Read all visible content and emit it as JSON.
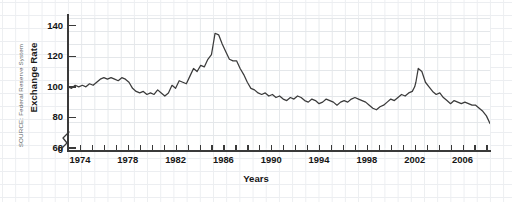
{
  "source_note": "SOURCE: Federal Reserve System",
  "chart_data": {
    "type": "line",
    "title": "",
    "subtitle": "",
    "xlabel": "Years",
    "ylabel": "Exchange Rate",
    "xlim": [
      1973.0,
      2008.3
    ],
    "ylim": [
      60,
      145
    ],
    "y_axis_break": true,
    "y_break_labels": [
      "0",
      "60"
    ],
    "grid": true,
    "legend": "none",
    "yticks": [
      140,
      120,
      100,
      80,
      60
    ],
    "ytick_labels": [
      "140",
      "120",
      "100",
      "80",
      "60"
    ],
    "y_zero_label": "0",
    "xticks": [
      1974,
      1975,
      1976,
      1977,
      1978,
      1979,
      1980,
      1981,
      1982,
      1983,
      1984,
      1985,
      1986,
      1987,
      1988,
      1989,
      1990,
      1991,
      1992,
      1993,
      1994,
      1995,
      1996,
      1997,
      1998,
      1999,
      2000,
      2001,
      2002,
      2003,
      2004,
      2005,
      2006,
      2007,
      2008
    ],
    "xtick_labels_major": [
      "1974",
      "1978",
      "1982",
      "1986",
      "1990",
      "1994",
      "1998",
      "2002",
      "2006"
    ],
    "xtick_label_years": [
      1974,
      1978,
      1982,
      1986,
      1990,
      1994,
      1998,
      2002,
      2006
    ],
    "line_color": "#3b3b3b",
    "series": [
      {
        "name": "Exchange Rate",
        "x": [
          1973.0,
          1973.3,
          1973.6,
          1973.9,
          1974.2,
          1974.5,
          1974.8,
          1975.1,
          1975.4,
          1975.7,
          1976.0,
          1976.3,
          1976.6,
          1976.9,
          1977.2,
          1977.5,
          1977.8,
          1978.1,
          1978.4,
          1978.7,
          1979.0,
          1979.3,
          1979.6,
          1979.9,
          1980.2,
          1980.5,
          1980.8,
          1981.1,
          1981.4,
          1981.7,
          1982.0,
          1982.3,
          1982.6,
          1982.9,
          1983.2,
          1983.5,
          1983.8,
          1984.1,
          1984.4,
          1984.7,
          1985.0,
          1985.15,
          1985.3,
          1985.6,
          1985.9,
          1986.2,
          1986.5,
          1986.8,
          1987.1,
          1987.4,
          1987.7,
          1988.0,
          1988.3,
          1988.6,
          1988.9,
          1989.2,
          1989.5,
          1989.8,
          1990.1,
          1990.4,
          1990.7,
          1991.0,
          1991.3,
          1991.6,
          1991.9,
          1992.2,
          1992.5,
          1992.8,
          1993.1,
          1993.4,
          1993.7,
          1994.0,
          1994.3,
          1994.6,
          1994.9,
          1995.2,
          1995.5,
          1995.8,
          1996.1,
          1996.4,
          1996.7,
          1997.0,
          1997.3,
          1997.6,
          1997.9,
          1998.2,
          1998.5,
          1998.8,
          1999.1,
          1999.4,
          1999.7,
          2000.0,
          2000.3,
          2000.6,
          2000.9,
          2001.2,
          2001.5,
          2001.8,
          2002.0,
          2002.1,
          2002.3,
          2002.6,
          2002.9,
          2003.2,
          2003.5,
          2003.8,
          2004.1,
          2004.4,
          2004.7,
          2005.0,
          2005.3,
          2005.6,
          2005.9,
          2006.2,
          2006.5,
          2006.8,
          2007.1,
          2007.4,
          2007.7,
          2008.0,
          2008.3
        ],
        "values": [
          100,
          99,
          101,
          100,
          101,
          100,
          102,
          101,
          103,
          105,
          106,
          105,
          106,
          105,
          104,
          106,
          105,
          103,
          99,
          97,
          96,
          97,
          95,
          96,
          95,
          98,
          96,
          94,
          96,
          101,
          99,
          104,
          103,
          102,
          107,
          112,
          110,
          114,
          113,
          118,
          121,
          128,
          135,
          134,
          128,
          123,
          118,
          117,
          117,
          112,
          108,
          103,
          99,
          98,
          96,
          95,
          96,
          94,
          95,
          93,
          94,
          92,
          91,
          93,
          92,
          94,
          93,
          91,
          90,
          92,
          91,
          89,
          90,
          92,
          91,
          90,
          88,
          90,
          91,
          90,
          92,
          93,
          92,
          91,
          90,
          88,
          86,
          85,
          87,
          88,
          90,
          92,
          91,
          93,
          95,
          94,
          96,
          97,
          100,
          103,
          112,
          110,
          103,
          100,
          97,
          95,
          96,
          93,
          91,
          89,
          91,
          90,
          89,
          90,
          89,
          88,
          88,
          86,
          84,
          81,
          76
        ]
      }
    ]
  },
  "axis_titles": {
    "y": "Exchange Rate",
    "x": "Years"
  }
}
